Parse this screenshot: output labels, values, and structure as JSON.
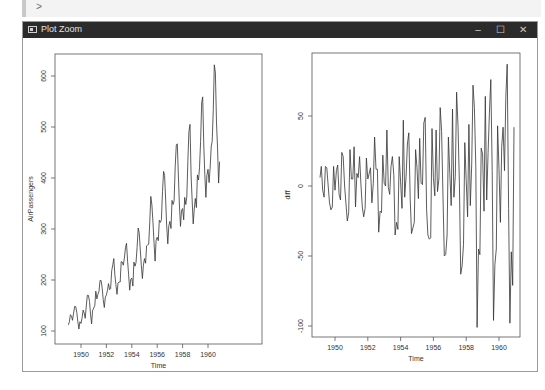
{
  "console": {
    "prompt": ">"
  },
  "window": {
    "title": "Plot Zoom",
    "controls": {
      "minimize": "–",
      "maximize": "☐",
      "close": "✕"
    },
    "icons": {
      "app": "plot-window-icon"
    }
  },
  "plots": {
    "left": {
      "xlabel": "Time",
      "ylabel": "AirPassengers",
      "xticks": [
        "1950",
        "1952",
        "1954",
        "1956",
        "1958",
        "1960"
      ],
      "yticks": [
        "100",
        "200",
        "300",
        "400",
        "500",
        "600"
      ]
    },
    "right": {
      "xlabel": "Time",
      "ylabel": "diff",
      "xticks": [
        "1950",
        "1952",
        "1954",
        "1956",
        "1958",
        "1960"
      ],
      "yticks": [
        "-100",
        "-50",
        "0",
        "50"
      ]
    }
  },
  "chart_data": [
    {
      "type": "line",
      "title": "",
      "xlabel": "Time",
      "ylabel": "AirPassengers",
      "x_start": 1949.0,
      "frequency": 12,
      "xlim": [
        1948.5,
        1961.0
      ],
      "ylim": [
        100,
        630
      ],
      "grid": false,
      "values": [
        112,
        118,
        132,
        129,
        121,
        135,
        148,
        148,
        136,
        119,
        104,
        118,
        115,
        126,
        141,
        135,
        125,
        149,
        170,
        170,
        158,
        133,
        114,
        140,
        145,
        150,
        178,
        163,
        172,
        178,
        199,
        199,
        184,
        162,
        146,
        166,
        171,
        180,
        193,
        181,
        183,
        218,
        230,
        242,
        209,
        191,
        172,
        194,
        196,
        196,
        236,
        235,
        229,
        243,
        264,
        272,
        237,
        211,
        180,
        201,
        204,
        188,
        235,
        227,
        234,
        264,
        302,
        293,
        259,
        229,
        203,
        229,
        242,
        233,
        267,
        269,
        270,
        315,
        364,
        347,
        312,
        274,
        237,
        278,
        284,
        277,
        317,
        313,
        318,
        374,
        413,
        405,
        355,
        306,
        271,
        306,
        315,
        301,
        356,
        348,
        355,
        422,
        465,
        467,
        404,
        347,
        305,
        336,
        340,
        318,
        362,
        348,
        363,
        435,
        491,
        505,
        404,
        359,
        310,
        337,
        360,
        342,
        406,
        396,
        420,
        472,
        548,
        559,
        463,
        407,
        362,
        405,
        417,
        391,
        419,
        461,
        472,
        535,
        622,
        606,
        508,
        461,
        390,
        432
      ]
    },
    {
      "type": "line",
      "title": "",
      "xlabel": "Time",
      "ylabel": "diff",
      "x_start": 1949.0833,
      "frequency": 12,
      "xlim": [
        1948.5,
        1961.0
      ],
      "ylim": [
        -101,
        87
      ],
      "grid": false,
      "values": [
        6,
        14,
        -3,
        -8,
        14,
        13,
        0,
        -12,
        -17,
        -15,
        14,
        -3,
        11,
        15,
        -6,
        -10,
        24,
        21,
        0,
        -12,
        -25,
        -19,
        26,
        5,
        5,
        28,
        -15,
        9,
        6,
        21,
        0,
        -15,
        -22,
        -16,
        20,
        5,
        9,
        13,
        -12,
        2,
        35,
        12,
        12,
        -33,
        -18,
        -19,
        22,
        2,
        0,
        40,
        -1,
        -6,
        14,
        21,
        8,
        -35,
        -26,
        -31,
        21,
        3,
        -16,
        47,
        -8,
        7,
        30,
        38,
        -9,
        -34,
        -30,
        -26,
        26,
        13,
        -9,
        34,
        2,
        1,
        45,
        49,
        -17,
        -35,
        -38,
        -37,
        41,
        6,
        -7,
        40,
        -4,
        5,
        56,
        39,
        -8,
        -50,
        -49,
        -35,
        35,
        9,
        -14,
        55,
        -8,
        7,
        67,
        43,
        2,
        -63,
        -57,
        -42,
        31,
        4,
        -22,
        44,
        -14,
        15,
        72,
        56,
        14,
        -101,
        -45,
        -49,
        27,
        23,
        -18,
        64,
        -10,
        24,
        52,
        76,
        11,
        -96,
        -56,
        -45,
        43,
        12,
        -26,
        28,
        42,
        11,
        63,
        87,
        -16,
        -98,
        -47,
        -71,
        42
      ]
    }
  ]
}
